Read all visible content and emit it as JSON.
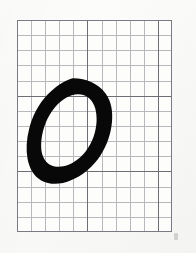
{
  "image": {
    "title": "Handwritten character specimen on graph paper",
    "width": 196,
    "height": 253,
    "background_color": "#fbfbfa",
    "media": "scanned grid / graph paper"
  },
  "grid": {
    "name": "graph-paper-grid",
    "left": 17,
    "top": 20,
    "width": 155,
    "height": 212,
    "columns": 11,
    "rows": 14,
    "cell_width": 14.09,
    "cell_height": 15.14,
    "minor_line_color": "#82828a",
    "major_line_color": "#606068",
    "major_line_every_columns": 5,
    "major_line_every_rows": 5,
    "border_color": "#7a7a82",
    "cell_fill_color": "#fdfdfc"
  },
  "ink": {
    "name": "handwritten-character",
    "character": "O",
    "stroke_color": "#080808",
    "bounding_box": {
      "left": 27,
      "top": 78,
      "right": 112,
      "bottom": 184,
      "width": 85,
      "height": 106
    },
    "inner_hole": {
      "left": 41,
      "top": 96,
      "right": 96,
      "bottom": 162
    },
    "stroke_weight": "thick",
    "style": "brush / marker, closed loop, slightly tilted counter-clockwise"
  },
  "marks": {
    "corner_mark_label": "",
    "corner_mark_color": "#96969c"
  }
}
